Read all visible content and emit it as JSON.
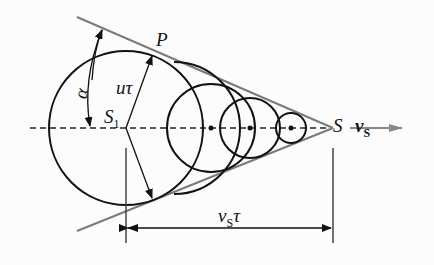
{
  "diagram": {
    "type": "mach-cone-shock-wave",
    "labels": {
      "P": "P",
      "alpha": "α",
      "u_tau_main": "u",
      "u_tau_sub": "τ",
      "S1_main": "S",
      "S1_sub": "1",
      "S": "S",
      "vS_main": "v",
      "vS_sub": "S",
      "vS_tau_main": "v",
      "vS_tau_sub": "S",
      "vS_tau_tail": "τ"
    },
    "colors": {
      "circle": "#111111",
      "tangent": "#7a7a7a",
      "axis": "#222222",
      "velocity_arrow": "#888888"
    }
  }
}
